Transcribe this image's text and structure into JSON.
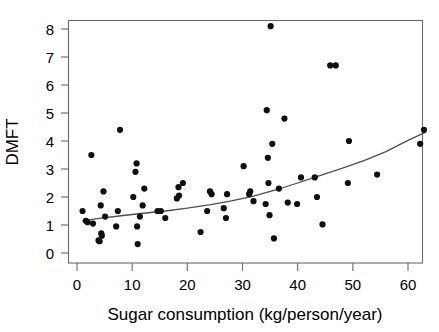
{
  "chart_data": {
    "type": "scatter",
    "title": "",
    "xlabel": "Sugar consumption (kg/person/year)",
    "ylabel": "DMFT",
    "xlim": [
      -1,
      64.5
    ],
    "ylim": [
      -0.25,
      8.45
    ],
    "xticks": [
      0,
      10,
      20,
      30,
      40,
      50,
      60
    ],
    "xticklabels": [
      "0",
      "10",
      "20",
      "30",
      "40",
      "50",
      "60"
    ],
    "yticks": [
      0,
      1,
      2,
      3,
      4,
      5,
      6,
      7,
      8
    ],
    "yticklabels": [
      "0",
      "1",
      "2",
      "3",
      "4",
      "5",
      "6",
      "7",
      "8"
    ],
    "grid": false,
    "legend": null,
    "legend_position": "none",
    "marker": "filled-circle",
    "marker_color": "#101010",
    "marker_size": 3.1,
    "points": [
      {
        "x": 1.0,
        "y": 1.5
      },
      {
        "x": 1.6,
        "y": 1.15
      },
      {
        "x": 1.9,
        "y": 1.1
      },
      {
        "x": 2.6,
        "y": 3.5
      },
      {
        "x": 2.9,
        "y": 1.05
      },
      {
        "x": 3.9,
        "y": 0.45
      },
      {
        "x": 4.1,
        "y": 0.42
      },
      {
        "x": 4.3,
        "y": 1.7
      },
      {
        "x": 4.4,
        "y": 0.7
      },
      {
        "x": 4.5,
        "y": 0.62
      },
      {
        "x": 4.8,
        "y": 2.2
      },
      {
        "x": 5.1,
        "y": 1.3
      },
      {
        "x": 7.1,
        "y": 0.95
      },
      {
        "x": 7.4,
        "y": 1.5
      },
      {
        "x": 7.8,
        "y": 4.4
      },
      {
        "x": 10.2,
        "y": 2.0
      },
      {
        "x": 10.6,
        "y": 2.9
      },
      {
        "x": 10.8,
        "y": 3.2
      },
      {
        "x": 10.9,
        "y": 0.95
      },
      {
        "x": 11.0,
        "y": 0.32
      },
      {
        "x": 11.4,
        "y": 1.3
      },
      {
        "x": 11.9,
        "y": 1.7
      },
      {
        "x": 12.2,
        "y": 2.3
      },
      {
        "x": 14.6,
        "y": 1.5
      },
      {
        "x": 15.2,
        "y": 1.5
      },
      {
        "x": 16.0,
        "y": 1.25
      },
      {
        "x": 18.1,
        "y": 1.95
      },
      {
        "x": 18.4,
        "y": 2.35
      },
      {
        "x": 18.5,
        "y": 2.05
      },
      {
        "x": 19.2,
        "y": 2.5
      },
      {
        "x": 22.4,
        "y": 0.75
      },
      {
        "x": 23.6,
        "y": 1.5
      },
      {
        "x": 24.1,
        "y": 2.2
      },
      {
        "x": 24.4,
        "y": 2.1
      },
      {
        "x": 26.6,
        "y": 1.6
      },
      {
        "x": 27.0,
        "y": 1.25
      },
      {
        "x": 27.2,
        "y": 2.1
      },
      {
        "x": 30.2,
        "y": 3.1
      },
      {
        "x": 31.2,
        "y": 2.1
      },
      {
        "x": 31.4,
        "y": 2.2
      },
      {
        "x": 32.0,
        "y": 1.85
      },
      {
        "x": 34.2,
        "y": 1.75
      },
      {
        "x": 34.4,
        "y": 5.1
      },
      {
        "x": 34.6,
        "y": 3.4
      },
      {
        "x": 34.7,
        "y": 2.5
      },
      {
        "x": 34.9,
        "y": 1.35
      },
      {
        "x": 35.1,
        "y": 8.1
      },
      {
        "x": 35.4,
        "y": 3.9
      },
      {
        "x": 35.7,
        "y": 0.52
      },
      {
        "x": 36.6,
        "y": 2.3
      },
      {
        "x": 37.6,
        "y": 4.8
      },
      {
        "x": 38.2,
        "y": 1.8
      },
      {
        "x": 39.9,
        "y": 1.75
      },
      {
        "x": 40.6,
        "y": 2.7
      },
      {
        "x": 43.1,
        "y": 2.7
      },
      {
        "x": 43.5,
        "y": 2.0
      },
      {
        "x": 44.5,
        "y": 1.02
      },
      {
        "x": 45.9,
        "y": 6.7
      },
      {
        "x": 46.9,
        "y": 6.7
      },
      {
        "x": 49.1,
        "y": 2.5
      },
      {
        "x": 49.3,
        "y": 4.0
      },
      {
        "x": 54.4,
        "y": 2.8
      },
      {
        "x": 62.2,
        "y": 3.9
      },
      {
        "x": 62.9,
        "y": 4.4
      }
    ],
    "fit_curve": {
      "name": "fitted smooth curve",
      "color": "#4a4a66",
      "x": [
        1.0,
        4.0,
        8.0,
        12.0,
        16.0,
        20.0,
        24.0,
        28.0,
        32.0,
        36.0,
        40.0,
        44.0,
        48.0,
        52.0,
        56.0,
        60.0,
        63.2
      ],
      "y": [
        1.15,
        1.24,
        1.33,
        1.42,
        1.5,
        1.6,
        1.72,
        1.86,
        2.03,
        2.25,
        2.5,
        2.76,
        3.02,
        3.3,
        3.62,
        4.02,
        4.32
      ]
    }
  }
}
